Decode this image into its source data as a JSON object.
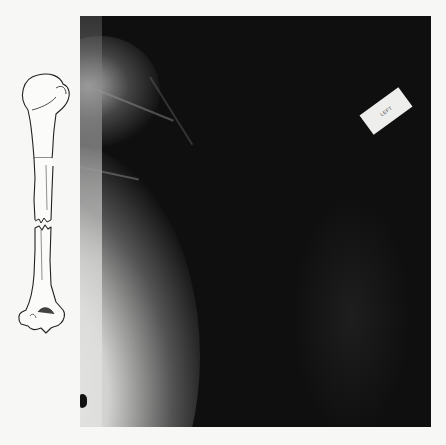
{
  "figure": {
    "illustration": {
      "subject": "humerus-bone-with-midshaft-fracture",
      "style": "line-drawing"
    },
    "xray": {
      "subject": "shoulder-upper-arm-radiograph",
      "label_text": "LEFT",
      "colors": {
        "film_background": "#0f0f0f",
        "soft_tissue_glow": "#e8e8e6",
        "page_background": "#f7f7f5"
      }
    }
  }
}
